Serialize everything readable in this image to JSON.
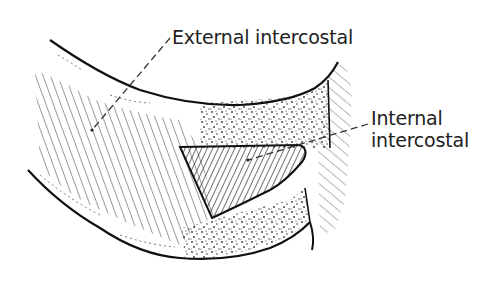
{
  "diagram": {
    "type": "anatomical-line-drawing",
    "labels": {
      "external": {
        "text": "External intercostal",
        "leader_from": [
          172,
          38
        ],
        "leader_to": [
          92,
          130
        ]
      },
      "internal": {
        "line1": "Internal",
        "line2": "intercostal",
        "leader_from": [
          370,
          124
        ],
        "leader_to": [
          248,
          160
        ]
      }
    },
    "regions": [
      {
        "name": "upper-rib",
        "fill": "outline"
      },
      {
        "name": "lower-rib",
        "fill": "outline"
      },
      {
        "name": "external-intercostal-muscle",
        "fill": "oblique-hatch"
      },
      {
        "name": "internal-intercostal-muscle",
        "fill": "dense-hatch-opposite-direction"
      },
      {
        "name": "costal-cartilage-upper",
        "fill": "stipple"
      },
      {
        "name": "costal-cartilage-lower",
        "fill": "stipple"
      },
      {
        "name": "sternal-edge-right",
        "fill": "light-oblique-hatch"
      }
    ],
    "colors": {
      "ink": "#222222",
      "background": "#ffffff"
    }
  }
}
